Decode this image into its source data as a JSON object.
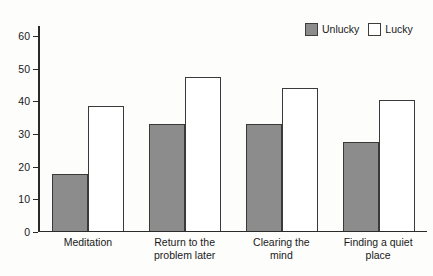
{
  "chart_data": {
    "type": "bar",
    "title": "",
    "xlabel": "",
    "ylabel": "",
    "ylim": [
      0,
      63
    ],
    "grid": false,
    "legend_position": "top-right",
    "categories": [
      "Meditation",
      "Return to the problem later",
      "Clearing the mind",
      "Finding a quiet place"
    ],
    "yticks": [
      0,
      10,
      20,
      30,
      40,
      50,
      60
    ],
    "ytick_labels": [
      "0",
      "10",
      "20",
      "30",
      "40",
      "50",
      "60"
    ],
    "series": [
      {
        "name": "Unlucky",
        "color": "#8c8c8c",
        "values": [
          17.2,
          32.5,
          32.5,
          27.0
        ]
      },
      {
        "name": "Lucky",
        "color": "#ffffff",
        "values": [
          38.0,
          47.0,
          43.5,
          40.0
        ]
      }
    ]
  },
  "legend": {
    "entries": [
      {
        "label": "Unlucky"
      },
      {
        "label": "Lucky"
      }
    ]
  },
  "category_lines": [
    [
      "Meditation"
    ],
    [
      "Return to the",
      "problem later"
    ],
    [
      "Clearing the",
      "mind"
    ],
    [
      "Finding a quiet",
      "place"
    ]
  ]
}
